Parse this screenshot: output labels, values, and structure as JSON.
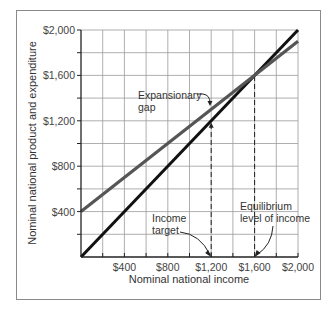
{
  "chart_data": {
    "type": "line",
    "title": "",
    "xlabel": "Nominal national income",
    "ylabel": "Nominal national product and expenditure",
    "xlim": [
      0,
      2000
    ],
    "ylim": [
      0,
      2000
    ],
    "grid": true,
    "grid_step": 200,
    "x_ticks": [
      400,
      800,
      1200,
      1600,
      2000
    ],
    "x_tick_labels": [
      "$400",
      "$800",
      "$1,200",
      "$1,600",
      "$2,000"
    ],
    "y_ticks": [
      400,
      800,
      1200,
      1600,
      2000
    ],
    "y_tick_labels": [
      "$400",
      "$800",
      "$1,200",
      "$1,600",
      "$2,000"
    ],
    "series": [
      {
        "name": "45-degree line (income = expenditure)",
        "color": "#111111",
        "x": [
          0,
          2000
        ],
        "y": [
          0,
          2000
        ]
      },
      {
        "name": "Aggregate expenditure",
        "color": "#555555",
        "x": [
          0,
          2000
        ],
        "y": [
          400,
          1900
        ]
      }
    ],
    "reference_lines": [
      {
        "x": 1200,
        "y_top": 1200,
        "style": "dashed",
        "label": "Income target"
      },
      {
        "x": 1600,
        "y_top": 1600,
        "style": "dashed",
        "label": "Equilibrium level of income"
      }
    ],
    "annotations": [
      {
        "text": [
          "Expansionary",
          "gap"
        ],
        "points_to": [
          1200,
          1250
        ]
      },
      {
        "text": [
          "Income",
          "target"
        ],
        "points_to": [
          1200,
          0
        ]
      },
      {
        "text": [
          "Equilibrium",
          "level of income"
        ],
        "points_to": [
          1600,
          0
        ]
      }
    ]
  }
}
